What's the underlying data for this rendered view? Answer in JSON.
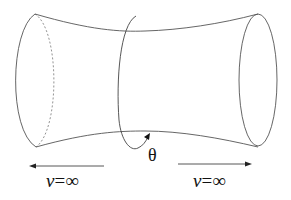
{
  "diagram": {
    "labels": {
      "theta": "θ",
      "left_end": {
        "var": "v",
        "eq": "=",
        "value": "∞"
      },
      "right_end": {
        "var": "v",
        "eq": "=",
        "value": "∞"
      }
    },
    "arrows": {
      "left": "pointing-left",
      "right": "pointing-right"
    },
    "colors": {
      "stroke": "#555555",
      "text": "#111111",
      "background": "#ffffff"
    }
  }
}
